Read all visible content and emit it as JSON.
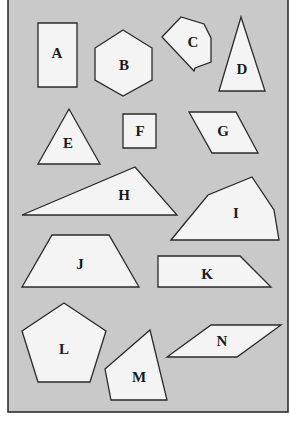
{
  "colors": {
    "page_background": "#ffffff",
    "panel_background": "#c9c9c9",
    "panel_border": "#222222",
    "shape_fill": "#f4f4f4",
    "shape_stroke": "#2a2a2a"
  },
  "panel": {
    "x": 8,
    "y": -2,
    "width": 280,
    "height": 414
  },
  "shapes": [
    {
      "label": "A",
      "kind": "rectangle",
      "points": "38,23 77,23 77,87 38,87",
      "label_pos": [
        57,
        53
      ]
    },
    {
      "label": "B",
      "kind": "hexagon",
      "points": "123,30 152,48 152,80 123,96 95,80 95,48",
      "label_pos": [
        124,
        65
      ]
    },
    {
      "label": "C",
      "kind": "heptagon",
      "points": "162,37 181,17 204,24 211,38 211,62 195,68 194,71",
      "label_pos": [
        193,
        42
      ]
    },
    {
      "label": "D",
      "kind": "triangle",
      "points": "241,17 265,91 219,91",
      "label_pos": [
        242,
        69
      ]
    },
    {
      "label": "E",
      "kind": "triangle",
      "points": "69,109 100,164 38,164",
      "label_pos": [
        68,
        143
      ]
    },
    {
      "label": "F",
      "kind": "square",
      "points": "123,114 156,114 156,148 123,148",
      "label_pos": [
        140,
        131
      ]
    },
    {
      "label": "G",
      "kind": "parallelogram",
      "points": "189,112 236,112 258,153 212,153",
      "label_pos": [
        223,
        131
      ]
    },
    {
      "label": "H",
      "kind": "triangle",
      "points": "22,215 135,167 177,215",
      "label_pos": [
        124,
        195
      ]
    },
    {
      "label": "I",
      "kind": "pentagon",
      "points": "171,240 208,195 252,177 274,210 279,240",
      "label_pos": [
        236,
        213
      ]
    },
    {
      "label": "J",
      "kind": "trapezoid",
      "points": "22,287 52,235 109,235 139,287",
      "label_pos": [
        80,
        264
      ]
    },
    {
      "label": "K",
      "kind": "trapezoid",
      "points": "158,256 240,256 271,287 158,287",
      "label_pos": [
        207,
        274
      ]
    },
    {
      "label": "L",
      "kind": "pentagon",
      "points": "64,303 106,331 90,382 38,382 22,331",
      "label_pos": [
        64,
        349
      ]
    },
    {
      "label": "M",
      "kind": "quadrilateral",
      "points": "150,330 167,400 111,400 105,369",
      "label_pos": [
        139,
        377
      ]
    },
    {
      "label": "N",
      "kind": "parallelogram",
      "points": "211,325 281,325 237,357 167,357",
      "label_pos": [
        222,
        341
      ]
    }
  ]
}
